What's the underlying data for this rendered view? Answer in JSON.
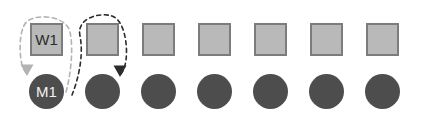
{
  "diagram": {
    "background_color": "#ffffff",
    "worker_row": {
      "label": "worker row",
      "shape": "square",
      "fill_color": "#b9b9b9",
      "border_color": "#7c7c7c",
      "count": 7,
      "size": 33,
      "start_x": 30,
      "y": 23,
      "spacing": 56,
      "nodes": [
        {
          "label": "W1"
        },
        {
          "label": ""
        },
        {
          "label": ""
        },
        {
          "label": ""
        },
        {
          "label": ""
        },
        {
          "label": ""
        },
        {
          "label": ""
        }
      ]
    },
    "machine_row": {
      "label": "machine row",
      "shape": "circle",
      "fill_color": "#4d4d4d",
      "text_color": "#f2f2f2",
      "count": 7,
      "size": 35,
      "start_x": 29,
      "y": 74,
      "spacing": 56,
      "nodes": [
        {
          "label": "M1"
        },
        {
          "label": ""
        },
        {
          "label": ""
        },
        {
          "label": ""
        },
        {
          "label": ""
        },
        {
          "label": ""
        },
        {
          "label": ""
        }
      ]
    },
    "arrows": [
      {
        "name": "assignment-arrow-1",
        "style": "dashed",
        "color": "#b3b3b3",
        "from": "M1",
        "to": "M1",
        "loops_around": "W1"
      },
      {
        "name": "assignment-arrow-2",
        "style": "dashed",
        "color": "#2b2b2b",
        "from": "M2",
        "to": "M2",
        "loops_around": "W2"
      }
    ]
  }
}
